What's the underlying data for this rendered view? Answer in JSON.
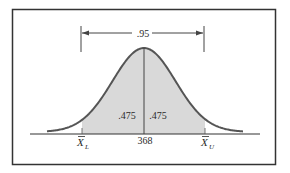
{
  "figure": {
    "type": "normal-distribution-confidence-interval",
    "interval_probability_label": ".95",
    "left_area_label": ".475",
    "right_area_label": ".475",
    "center_value_label": "368",
    "lower_bound_label": {
      "symbol": "X",
      "subscript": "L",
      "overbar": true
    },
    "upper_bound_label": {
      "symbol": "X",
      "subscript": "U",
      "overbar": true
    },
    "colors": {
      "curve": "#555555",
      "shading": "#d9d9d9",
      "frame": "#333333",
      "axis": "#333333",
      "text": "#2a2a2a"
    }
  }
}
